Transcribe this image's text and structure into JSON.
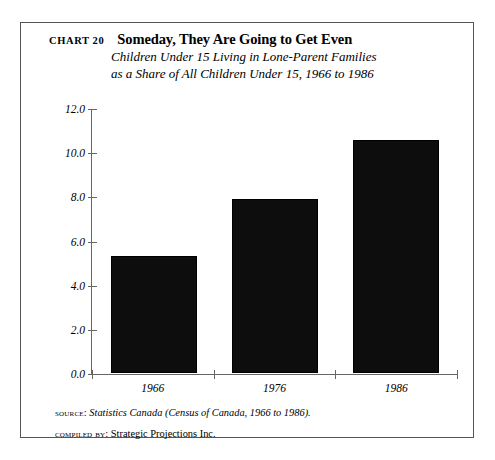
{
  "chart_number": "CHART 20",
  "title": "Someday, They Are Going to Get Even",
  "subtitle_line_1": "Children Under 15 Living in Lone-Parent Families",
  "subtitle_line_2": "as a Share of All Children Under 15, 1966 to 1986",
  "notes": {
    "source_label": "Source:",
    "source_text": "Statistics Canada (Census of Canada, 1966 to 1986).",
    "compiled_label": "Compiled by:",
    "compiled_text": "Strategic Projections Inc."
  },
  "colors": {
    "bar": "#0d0d0d",
    "axis": "#666666",
    "frame": "#555555",
    "text": "#000000"
  },
  "chart_data": {
    "type": "bar",
    "title": "Someday, They Are Going to Get Even",
    "subtitle": "Children Under 15 Living in Lone-Parent Families as a Share of All Children Under 15, 1966 to 1986",
    "categories": [
      "1966",
      "1976",
      "1986"
    ],
    "values": [
      5.3,
      7.9,
      10.6
    ],
    "xlabel": "",
    "ylabel": "",
    "ylim": [
      0.0,
      12.0
    ],
    "yticks": [
      "0.0",
      "2.0",
      "4.0",
      "6.0",
      "8.0",
      "10.0",
      "12.0"
    ],
    "ytick_values": [
      0.0,
      2.0,
      4.0,
      6.0,
      8.0,
      10.0,
      12.0
    ],
    "grid": false,
    "legend": false,
    "units": "percent share"
  }
}
